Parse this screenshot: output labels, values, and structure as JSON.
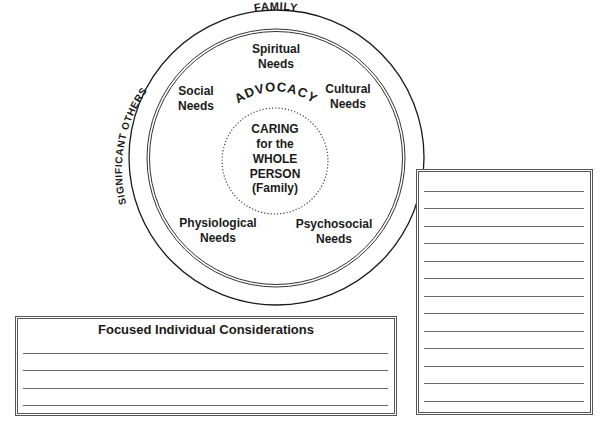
{
  "diagram": {
    "outer_ring_labels": {
      "top": "FAMILY",
      "left": "SIGNIFICANT OTHERS"
    },
    "needs": [
      {
        "line1": "Spiritual",
        "line2": "Needs"
      },
      {
        "line1": "Social",
        "line2": "Needs"
      },
      {
        "line1": "Cultural",
        "line2": "Needs"
      },
      {
        "line1": "Physiological",
        "line2": "Needs"
      },
      {
        "line1": "Psychosocial",
        "line2": "Needs"
      }
    ],
    "arc_label": "ADVOCACY",
    "center": {
      "lines": [
        "CARING",
        "for the",
        "WHOLE",
        "PERSON",
        "(Family)"
      ]
    }
  },
  "considerations_box": {
    "title": "Focused Individual Considerations",
    "line_count": 4
  },
  "notes_box": {
    "line_count": 13
  },
  "colors": {
    "ink": "#1a1a1a",
    "rule": "#6a6a6a",
    "border": "#555555"
  }
}
